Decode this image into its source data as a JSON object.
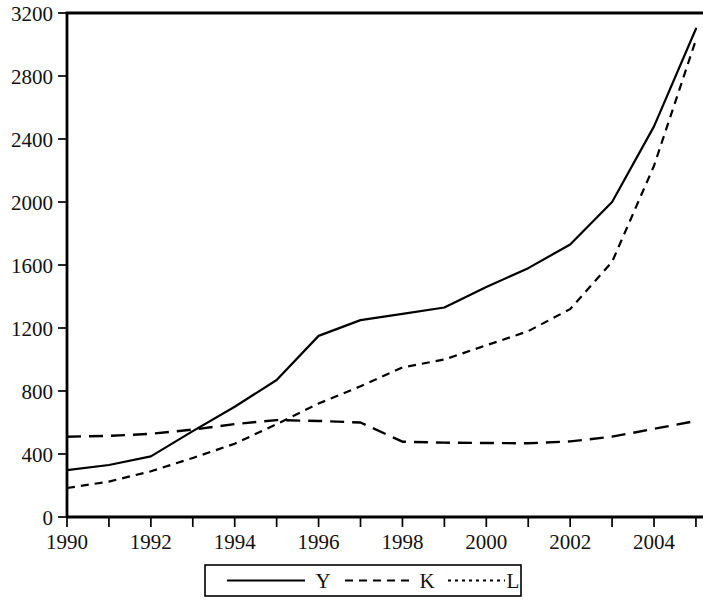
{
  "chart_data": {
    "type": "line",
    "title": "",
    "subtitle": "",
    "xlabel": "",
    "ylabel": "",
    "xlim": [
      1990,
      2005
    ],
    "ylim": [
      0,
      3200
    ],
    "grid": false,
    "legend_position": "bottom-center",
    "x": [
      1990,
      1991,
      1992,
      1993,
      1994,
      1995,
      1996,
      1997,
      1998,
      1999,
      2000,
      2001,
      2002,
      2003,
      2004,
      2005
    ],
    "y_tick_labels": [
      "0",
      "400",
      "800",
      "1200",
      "1600",
      "2000",
      "2400",
      "2800",
      "3200"
    ],
    "y_tick_values": [
      0,
      400,
      800,
      1200,
      1600,
      2000,
      2400,
      2800,
      3200
    ],
    "x_tick_labels": [
      "1990",
      "1992",
      "1994",
      "1996",
      "1998",
      "2000",
      "2002",
      "2004"
    ],
    "x_tick_values": [
      1990,
      1992,
      1994,
      1996,
      1998,
      2000,
      2002,
      2004
    ],
    "x_minor_ticks": [
      1991,
      1993,
      1995,
      1997,
      1999,
      2001,
      2003,
      2005
    ],
    "series": [
      {
        "name": "Y",
        "style": "solid",
        "values": [
          298,
          330,
          385,
          545,
          700,
          870,
          1150,
          1250,
          1290,
          1330,
          1460,
          1580,
          1730,
          2000,
          2480,
          3100
        ]
      },
      {
        "name": "K",
        "style": "dashed",
        "values": [
          184,
          225,
          290,
          375,
          465,
          590,
          720,
          830,
          950,
          1000,
          1090,
          1180,
          1320,
          1620,
          2230,
          3030
        ]
      },
      {
        "name": "L",
        "style": "long-dashed",
        "values": [
          510,
          515,
          528,
          555,
          590,
          615,
          610,
          600,
          478,
          472,
          470,
          468,
          480,
          510,
          560,
          610
        ]
      }
    ]
  },
  "legend": {
    "entries": [
      {
        "label": "Y",
        "style": "solid"
      },
      {
        "label": "K",
        "style": "dashed"
      },
      {
        "label": "L",
        "style": "dotted"
      }
    ]
  },
  "colors": {
    "line": "#000000",
    "background": "#ffffff",
    "text": "#111111"
  }
}
